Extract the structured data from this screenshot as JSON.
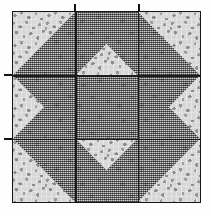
{
  "image": {
    "kind": "quilt-block-photo",
    "title": "Nine-patch star quilt block",
    "width": 211,
    "height": 216,
    "background_color": "#fefefe"
  },
  "block": {
    "name": "card-trick-star-block",
    "left": 12,
    "top": 11,
    "width": 189,
    "height": 192,
    "border_color": "#171717",
    "grid_rows": 3,
    "grid_cols": 3,
    "seam_color": "#1b1b1b"
  },
  "fabrics": [
    {
      "id": "light-floral",
      "label": "Light gray floral print",
      "base_color": "#d7d7d7",
      "motif_color": "#8e8e8e"
    },
    {
      "id": "dark-check",
      "label": "Dark gray checked print",
      "base_color": "#9a9a9a",
      "motif_color": "#232323"
    }
  ],
  "cells": [
    {
      "name": "cell-top-left",
      "row": 0,
      "col": 0,
      "base": "light-floral",
      "triangles": [
        {
          "fabric": "dark-check",
          "orientation": "tri-br"
        }
      ]
    },
    {
      "name": "cell-top-center",
      "row": 0,
      "col": 1,
      "base": "light-floral",
      "triangles": [
        {
          "fabric": "dark-check",
          "orientation": "tri-tl"
        },
        {
          "fabric": "dark-check",
          "orientation": "tri-tr"
        }
      ]
    },
    {
      "name": "cell-top-right",
      "row": 0,
      "col": 2,
      "base": "light-floral",
      "triangles": [
        {
          "fabric": "dark-check",
          "orientation": "tri-bl"
        }
      ]
    },
    {
      "name": "cell-middle-left",
      "row": 1,
      "col": 0,
      "base": "light-floral",
      "triangles": [
        {
          "fabric": "dark-check",
          "orientation": "tri-tr"
        },
        {
          "fabric": "dark-check",
          "orientation": "tri-br"
        }
      ]
    },
    {
      "name": "cell-center",
      "row": 1,
      "col": 1,
      "base": "dark-check",
      "triangles": []
    },
    {
      "name": "cell-middle-right",
      "row": 1,
      "col": 2,
      "base": "light-floral",
      "triangles": [
        {
          "fabric": "dark-check",
          "orientation": "tri-tl"
        },
        {
          "fabric": "dark-check",
          "orientation": "tri-bl"
        }
      ]
    },
    {
      "name": "cell-bottom-left",
      "row": 2,
      "col": 0,
      "base": "light-floral",
      "triangles": [
        {
          "fabric": "dark-check",
          "orientation": "tri-tr"
        }
      ]
    },
    {
      "name": "cell-bottom-center",
      "row": 2,
      "col": 1,
      "base": "light-floral",
      "triangles": [
        {
          "fabric": "dark-check",
          "orientation": "tri-bl"
        },
        {
          "fabric": "dark-check",
          "orientation": "tri-br"
        }
      ]
    },
    {
      "name": "cell-bottom-right",
      "row": 2,
      "col": 2,
      "base": "light-floral",
      "triangles": [
        {
          "fabric": "dark-check",
          "orientation": "tri-tl"
        }
      ]
    }
  ],
  "seams": {
    "vertical_positions_pct": [
      33.333,
      66.666
    ],
    "horizontal_positions_pct": [
      33.333,
      66.666
    ]
  },
  "ticks": {
    "top": [
      {
        "name": "tick-top-left-seam",
        "x": 74
      },
      {
        "name": "tick-top-right-seam",
        "x": 138
      }
    ],
    "left": [
      {
        "name": "tick-left-upper-seam",
        "y": 74
      },
      {
        "name": "tick-left-lower-seam",
        "y": 138
      }
    ]
  }
}
